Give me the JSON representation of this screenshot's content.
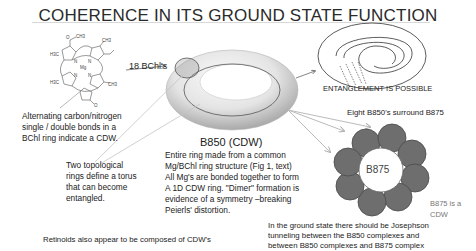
{
  "title": "COHERENCE IN ITS GROUND STATE FUNCTION",
  "molecule": {
    "name": "bacteriochlorophyll-structure",
    "labels": [
      "O",
      "CH3",
      "H3C",
      "CH3",
      "Mg",
      "N",
      "N",
      "N",
      "N",
      "H3C",
      "CH3",
      "O"
    ]
  },
  "bchl_count_label": "18 BChl's",
  "cdw_note": {
    "lines": [
      "Alternating carbon/nitrogen",
      "single / double bonds in a",
      "BChl ring indicate a CDW."
    ]
  },
  "torus_note": {
    "lines": [
      "Two topological",
      "rings define a torus",
      "that can become",
      "entangled."
    ]
  },
  "b850": {
    "heading": "B850 (CDW)",
    "lines": [
      "Entire ring made from a common",
      "Mg/BChl ring structure (Fig 1, text)",
      "All Mg's are bonded together to form",
      "A 1D CDW ring.  \"Dimer\" formation is",
      "evidence of a symmetry –breaking",
      "Peierls' distortion."
    ]
  },
  "entanglement_label": "ENTANGLEMENT IS POSSIBLE",
  "b875": {
    "surround_label": "Eight B850's surround B875",
    "center_label": "B875",
    "cdw_label": "B875 is a CDW",
    "satellite_count": 8
  },
  "josephson_note": {
    "lines": [
      "In the ground state there should be Josephson",
      "tunneling between the B850 complexes and",
      "between B850 complexes and B875 complex"
    ]
  },
  "retinoids_note": "Retinoids also appear to be composed of CDW's",
  "colors": {
    "satellite_fill": "#6e6e6e",
    "satellite_stroke": "#4a4a4a",
    "arrow_gray": "#b8b8b8",
    "torus_light": "#f2f2f2",
    "torus_dark": "#a8a8a8"
  }
}
